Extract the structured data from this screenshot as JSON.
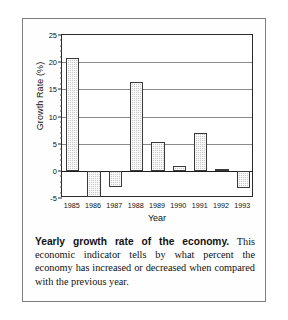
{
  "figure": {
    "caption_bold": "Yearly growth rate of the economy.",
    "caption_rest": " This economic indicator tells by what percent the economy has increased or decreased when compared with the previous year."
  },
  "chart_data": {
    "type": "bar",
    "title": "",
    "xlabel": "Year",
    "ylabel": "Growth Rate (%)",
    "categories": [
      "1985",
      "1986",
      "1987",
      "1988",
      "1989",
      "1990",
      "1991",
      "1992",
      "1993"
    ],
    "values": [
      20.8,
      -4.8,
      -3.0,
      16.3,
      5.3,
      0.8,
      6.9,
      0.3,
      -3.1
    ],
    "ylim": [
      -5,
      25
    ],
    "ytick_labels": [
      "25",
      "20",
      "15",
      "10",
      "5",
      "0",
      "-5"
    ],
    "ytick_values": [
      25,
      20,
      15,
      10,
      5,
      0,
      -5
    ],
    "grid": true,
    "legend": "none",
    "bar_fill_color": "#c9c9c9",
    "bar_edge_color": "#3a3a3a",
    "axis_color": "#2b2b2b"
  }
}
